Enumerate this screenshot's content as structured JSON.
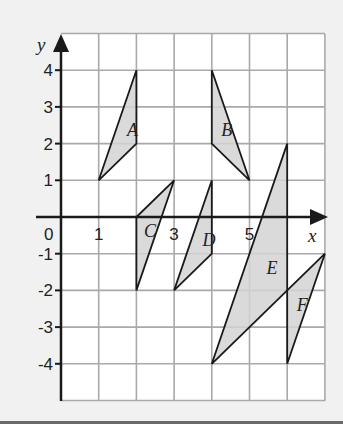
{
  "diagram": {
    "axes": {
      "x_label": "x",
      "y_label": "y",
      "origin_label": "0",
      "x_ticks": [
        {
          "value": 1,
          "label": "1"
        },
        {
          "value": 3,
          "label": "3"
        },
        {
          "value": 5,
          "label": "5"
        }
      ],
      "y_ticks": [
        {
          "value": 4,
          "label": "4"
        },
        {
          "value": 3,
          "label": "3"
        },
        {
          "value": 2,
          "label": "2"
        },
        {
          "value": 1,
          "label": "1"
        },
        {
          "value": -1,
          "label": "-1"
        },
        {
          "value": -2,
          "label": "-2"
        },
        {
          "value": -3,
          "label": "-3"
        },
        {
          "value": -4,
          "label": "-4"
        }
      ],
      "x_range": [
        0,
        7
      ],
      "y_range": [
        -5,
        5
      ]
    },
    "shapes": [
      {
        "label": "A",
        "vertices": [
          [
            1,
            1
          ],
          [
            2,
            4
          ],
          [
            2,
            2
          ]
        ],
        "label_pos": [
          1.75,
          2.2
        ]
      },
      {
        "label": "B",
        "vertices": [
          [
            4,
            4
          ],
          [
            4,
            2
          ],
          [
            5,
            1
          ]
        ],
        "label_pos": [
          4.25,
          2.2
        ]
      },
      {
        "label": "C",
        "vertices": [
          [
            2,
            0
          ],
          [
            3,
            1
          ],
          [
            2,
            -2
          ]
        ],
        "label_pos": [
          2.2,
          -0.55
        ]
      },
      {
        "label": "D",
        "vertices": [
          [
            3,
            -2
          ],
          [
            4,
            1
          ],
          [
            4,
            -1
          ]
        ],
        "label_pos": [
          3.75,
          -0.8
        ]
      },
      {
        "label": "E",
        "vertices": [
          [
            4,
            -4
          ],
          [
            6,
            2
          ],
          [
            6,
            -2
          ]
        ],
        "label_pos": [
          5.45,
          -1.55
        ]
      },
      {
        "label": "F",
        "vertices": [
          [
            6,
            -4
          ],
          [
            7,
            -1
          ],
          [
            6,
            -2
          ]
        ],
        "label_pos": [
          6.25,
          -2.55
        ]
      }
    ],
    "colors": {
      "background": "#f1f1f1",
      "grid_bg": "#ffffff",
      "grid_line": "#a9a9a9",
      "axis": "#1a1a1a",
      "shape_fill": "#d4d4d4",
      "shape_stroke": "#1a1a1a"
    }
  }
}
